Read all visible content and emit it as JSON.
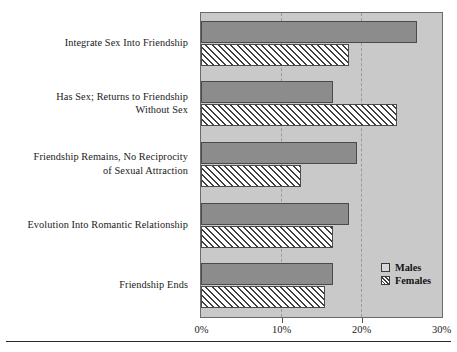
{
  "chart_data": {
    "type": "bar",
    "orientation": "horizontal",
    "title": "",
    "subtitle": "",
    "xlabel": "",
    "ylabel": "",
    "xlim": [
      0,
      30
    ],
    "xunit": "%",
    "grid": true,
    "grid_axis": "x",
    "legend_position": "bottom-right",
    "xticks": [
      0,
      10,
      20,
      30
    ],
    "xtick_labels": [
      "0%",
      "10%",
      "20%",
      "30%"
    ],
    "categories": [
      "Integrate Sex Into Friendship",
      "Has Sex; Returns to Friendship\nWithout Sex",
      "Friendship Remains, No Reciprocity\nof Sexual Attraction",
      "Evolution Into Romantic Relationship",
      "Friendship Ends"
    ],
    "category_lines": [
      [
        "Integrate Sex Into Friendship"
      ],
      [
        "Has Sex; Returns to Friendship",
        "Without Sex"
      ],
      [
        "Friendship Remains, No Reciprocity",
        "of Sexual Attraction"
      ],
      [
        "Evolution Into Romantic Relationship"
      ],
      [
        "Friendship Ends"
      ]
    ],
    "series": [
      {
        "name": "Males",
        "values": [
          27.0,
          16.5,
          19.5,
          18.5,
          16.5
        ]
      },
      {
        "name": "Females",
        "values": [
          18.5,
          24.5,
          12.5,
          16.5,
          15.5
        ]
      }
    ]
  },
  "legend": {
    "items": [
      {
        "label": "Males",
        "swatch": "solid-gray-square-icon"
      },
      {
        "label": "Females",
        "swatch": "diagonal-hatch-square-icon"
      }
    ]
  },
  "colors": {
    "plot_background": "#c9c9c9",
    "plot_border": "#6b6b6b",
    "males_fill": "#8c8c8c",
    "females_fill": "#ffffff",
    "females_hatch": "#3f3f3f",
    "bar_border": "#4a4a4a",
    "gridline": "#9a9a9a",
    "text": "#1a1a1a",
    "page_background": "#ffffff"
  }
}
